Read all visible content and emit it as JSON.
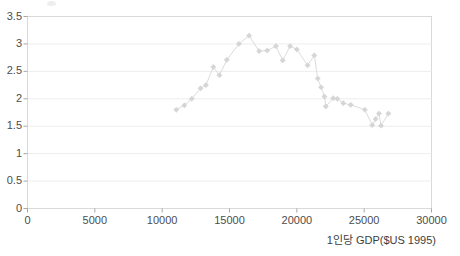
{
  "chart": {
    "title": "",
    "subtitle": ""
  },
  "axes": {
    "y_ticks": [
      "0",
      "0.5",
      "1",
      "1.5",
      "2",
      "2.5",
      "3",
      "3.5"
    ],
    "x_ticks": [
      "0",
      "5000",
      "10000",
      "15000",
      "20000",
      "25000",
      "30000"
    ],
    "x_axis_title": "1인당 GDP($US 1995)",
    "y_axis_title": ""
  },
  "style": {
    "gridline_color": "#ededed",
    "frame_color": "#d9d9d9",
    "series_line_color": "#dcdcdc",
    "series_marker_color": "#d5d5d5",
    "tick_text_color": "#4d4d4d",
    "background": "#ffffff"
  },
  "chart_data": {
    "type": "line",
    "title": "",
    "xlabel": "1인당 GDP($US 1995)",
    "ylabel": "",
    "xlim": [
      0,
      30000
    ],
    "ylim": [
      0,
      3.5
    ],
    "xticks": [
      0,
      5000,
      10000,
      15000,
      20000,
      25000,
      30000
    ],
    "yticks": [
      0,
      0.5,
      1,
      1.5,
      2,
      2.5,
      3,
      3.5
    ],
    "grid": "horizontal",
    "legend": "none",
    "markers": "diamond",
    "series": [
      {
        "name": "series-1",
        "points": [
          [
            11050,
            1.8
          ],
          [
            11650,
            1.88
          ],
          [
            12200,
            2.0
          ],
          [
            12850,
            2.19
          ],
          [
            13250,
            2.25
          ],
          [
            13800,
            2.58
          ],
          [
            14250,
            2.43
          ],
          [
            14800,
            2.71
          ],
          [
            15700,
            3.0
          ],
          [
            16450,
            3.15
          ],
          [
            17200,
            2.87
          ],
          [
            17800,
            2.88
          ],
          [
            18450,
            2.96
          ],
          [
            18950,
            2.7
          ],
          [
            19500,
            2.96
          ],
          [
            20000,
            2.9
          ],
          [
            20800,
            2.61
          ],
          [
            21300,
            2.79
          ],
          [
            21550,
            2.37
          ],
          [
            21800,
            2.21
          ],
          [
            22050,
            2.04
          ],
          [
            22150,
            1.86
          ],
          [
            22700,
            2.01
          ],
          [
            23000,
            2.0
          ],
          [
            23450,
            1.92
          ],
          [
            24000,
            1.89
          ],
          [
            25050,
            1.8
          ],
          [
            25600,
            1.52
          ],
          [
            25850,
            1.63
          ],
          [
            26100,
            1.73
          ],
          [
            26250,
            1.51
          ],
          [
            26800,
            1.73
          ]
        ]
      }
    ]
  }
}
